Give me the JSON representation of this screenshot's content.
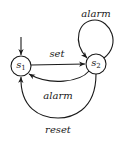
{
  "diagram": {
    "type": "state-machine",
    "stroke_color": "#1a1a1a",
    "background": "#ffffff",
    "states": [
      {
        "id": "s1",
        "name": "s",
        "subscript": "1",
        "initial": true,
        "cx": 21,
        "cy": 66,
        "r": 10
      },
      {
        "id": "s2",
        "name": "s",
        "subscript": "2",
        "initial": false,
        "cx": 96,
        "cy": 64,
        "r": 10
      }
    ],
    "transitions": [
      {
        "id": "t-set",
        "from": "s1",
        "to": "s2",
        "label": "set",
        "label_x": 57,
        "label_y": 54
      },
      {
        "id": "t-alarm-self",
        "from": "s2",
        "to": "s2",
        "label": "alarm",
        "label_x": 96,
        "label_y": 14
      },
      {
        "id": "t-alarm-back",
        "from": "s2",
        "to": "s1",
        "label": "alarm",
        "label_x": 58,
        "label_y": 96
      },
      {
        "id": "t-reset",
        "from": "s2",
        "to": "s1",
        "label": "reset",
        "label_x": 58,
        "label_y": 130
      }
    ]
  }
}
